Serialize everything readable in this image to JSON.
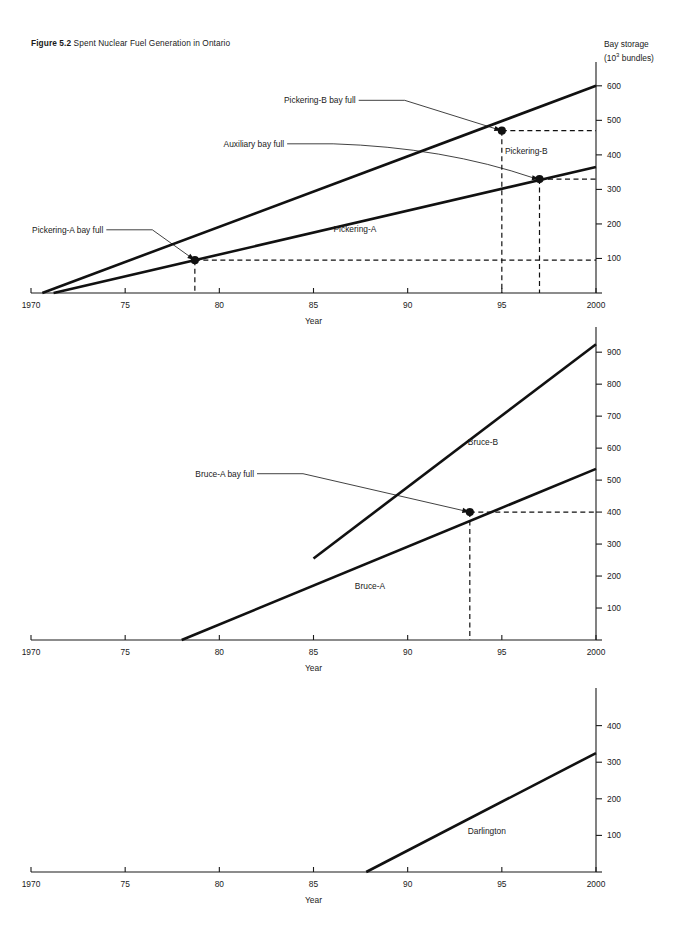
{
  "figure": {
    "number": "Figure 5.2",
    "title": "Spent Nuclear Fuel Generation in Ontario"
  },
  "axis": {
    "y_label_line1": "Bay storage",
    "y_label_line2_pre": "(10",
    "y_label_line2_sup": "3",
    "y_label_line2_post": " bundles)",
    "x_label": "Year"
  },
  "chart_data": [
    {
      "type": "line",
      "id": "pickering",
      "title": "Pickering",
      "xlabel": "Year",
      "ylabel": "Bay storage (10^3 bundles)",
      "xlim": [
        1970,
        2000
      ],
      "ylim": [
        0,
        640
      ],
      "xticks": [
        1970,
        1975,
        1980,
        1985,
        1990,
        1995,
        2000
      ],
      "xticklabels": [
        "1970",
        "75",
        "80",
        "85",
        "90",
        "95",
        "2000"
      ],
      "yticks": [
        0,
        100,
        200,
        300,
        400,
        500,
        600
      ],
      "yticklabels": [
        "",
        "100",
        "200",
        "300",
        "400",
        "500",
        "600"
      ],
      "grid": false,
      "legend": "inline-labels",
      "series": [
        {
          "name": "Pickering-A",
          "label_x": 1987.2,
          "label_y": 178,
          "points": [
            [
              1971.2,
              0
            ],
            [
              2000,
              365
            ]
          ]
        },
        {
          "name": "Pickering-B",
          "label_x": 1996.3,
          "label_y": 402,
          "points": [
            [
              1970.6,
              0
            ],
            [
              2000,
              600
            ]
          ]
        }
      ],
      "annotations": [
        {
          "text": "Pickering-A bay full",
          "point_x": 1978.7,
          "point_y": 95,
          "text_x": 1974.0,
          "text_y": 183,
          "marker": true
        },
        {
          "text": "Pickering-B bay full",
          "point_x": 1995.0,
          "point_y": 470,
          "text_x": 1987.4,
          "text_y": 558,
          "marker": true
        },
        {
          "text": "Auxiliary bay full",
          "point_x": 1997.0,
          "point_y": 330,
          "text_x": 1983.6,
          "text_y": 432,
          "marker": true
        }
      ]
    },
    {
      "type": "line",
      "id": "bruce",
      "title": "Bruce",
      "xlabel": "Year",
      "ylabel": "Bay storage (10^3 bundles)",
      "xlim": [
        1970,
        2000
      ],
      "ylim": [
        0,
        960
      ],
      "xticks": [
        1970,
        1975,
        1980,
        1985,
        1990,
        1995,
        2000
      ],
      "xticklabels": [
        "1970",
        "75",
        "80",
        "85",
        "90",
        "95",
        "2000"
      ],
      "yticks": [
        0,
        100,
        200,
        300,
        400,
        500,
        600,
        700,
        800,
        900
      ],
      "yticklabels": [
        "",
        "100",
        "200",
        "300",
        "400",
        "500",
        "600",
        "700",
        "800",
        "900"
      ],
      "grid": false,
      "legend": "inline-labels",
      "series": [
        {
          "name": "Bruce-A",
          "label_x": 1988.0,
          "label_y": 160,
          "points": [
            [
              1978.0,
              0
            ],
            [
              2000,
              535
            ]
          ]
        },
        {
          "name": "Bruce-B",
          "label_x": 1994.0,
          "label_y": 610,
          "points": [
            [
              1985.0,
              255
            ],
            [
              2000,
              925
            ]
          ]
        }
      ],
      "annotations": [
        {
          "text": "Bruce-A bay full",
          "point_x": 1993.3,
          "point_y": 400,
          "text_x": 1982.0,
          "text_y": 520,
          "marker": true
        }
      ]
    },
    {
      "type": "line",
      "id": "darlington",
      "title": "Darlington",
      "xlabel": "Year",
      "ylabel": "Bay storage (10^3 bundles)",
      "xlim": [
        1970,
        2000
      ],
      "ylim": [
        0,
        470
      ],
      "xticks": [
        1970,
        1975,
        1980,
        1985,
        1990,
        1995,
        2000
      ],
      "xticklabels": [
        "1970",
        "75",
        "80",
        "85",
        "90",
        "95",
        "2000"
      ],
      "yticks": [
        0,
        100,
        200,
        300,
        400
      ],
      "yticklabels": [
        "",
        "100",
        "200",
        "300",
        "400"
      ],
      "grid": false,
      "legend": "inline-labels",
      "series": [
        {
          "name": "Darlington",
          "label_x": 1994.2,
          "label_y": 105,
          "points": [
            [
              1987.8,
              0
            ],
            [
              2000,
              325
            ]
          ]
        }
      ],
      "annotations": []
    }
  ]
}
